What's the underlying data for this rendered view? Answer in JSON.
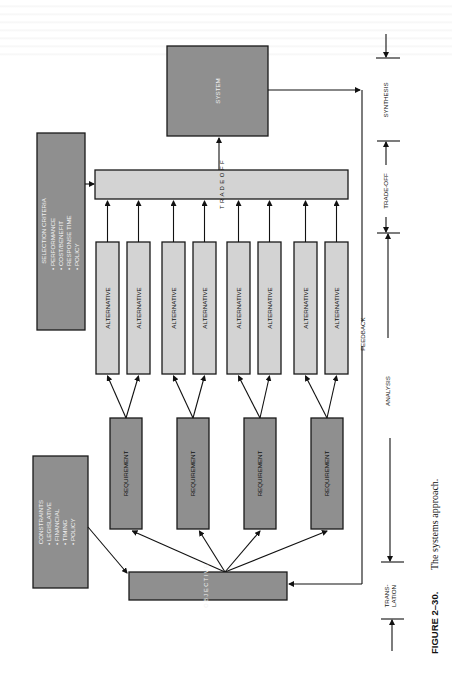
{
  "figure": {
    "number": "FIGURE 2–30.",
    "caption": "The systems approach."
  },
  "nodes": {
    "system": "SYSTEM",
    "trade_off": "T R A D E   O F F",
    "objective": "O B J E C T I V E",
    "alternatives": [
      "ALTERNATIVE",
      "ALTERNATIVE",
      "ALTERNATIVE",
      "ALTERNATIVE",
      "ALTERNATIVE",
      "ALTERNATIVE",
      "ALTERNATIVE",
      "ALTERNATIVE"
    ],
    "requirements": [
      "REQUIREMENT",
      "REQUIREMENT",
      "REQUIREMENT",
      "REQUIREMENT"
    ],
    "selection_criteria": {
      "title": "SELECTION CRITERIA",
      "items": [
        "• PERFORMANCE",
        "• COST/BENEFIT",
        "• RESPONSE TIME",
        "• POLICY"
      ]
    },
    "constraints": {
      "title": "CONSTRAINTS",
      "items": [
        "• LEGISLATIVE",
        "• FINANCIAL",
        "• TIMING",
        "• POLICY"
      ]
    }
  },
  "feedback_label": "FEEDBACK",
  "phases": {
    "synthesis": "SYNTHESIS",
    "trade_off": "TRADE-OFF",
    "analysis": "ANALYSIS",
    "translation_1": "TRANS-",
    "translation_2": "LATION"
  }
}
